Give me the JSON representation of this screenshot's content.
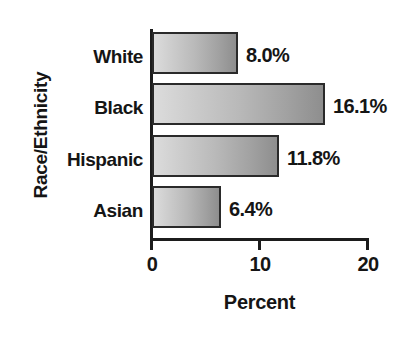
{
  "chart_data": {
    "type": "bar",
    "orientation": "horizontal",
    "title": "",
    "xlabel": "Percent",
    "ylabel": "Race/Ethnicity",
    "categories": [
      "White",
      "Black",
      "Hispanic",
      "Asian"
    ],
    "values": [
      8.0,
      16.1,
      11.8,
      6.4
    ],
    "value_labels": [
      "8.0%",
      "16.1%",
      "11.8%",
      "6.4%"
    ],
    "xlim": [
      0,
      20
    ],
    "xticks": [
      0,
      10,
      20
    ],
    "xtick_labels": [
      "0",
      "10",
      "20"
    ],
    "grid": false,
    "legend": false,
    "bar_fill_light": "#dcdcdc",
    "bar_fill_dark": "#8e8e8e",
    "bar_border_color": "#2a2a2a",
    "axis_color": "#1c1c1c",
    "text_color": "#151515",
    "background": "#ffffff"
  }
}
